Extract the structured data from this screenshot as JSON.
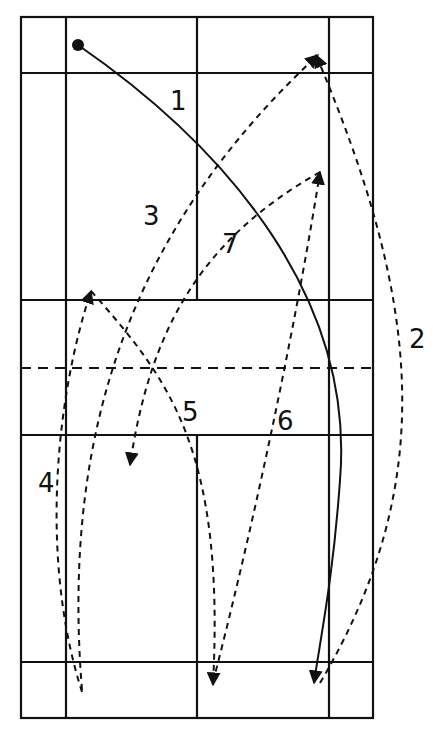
{
  "diagram": {
    "colors": {
      "line": "#111111",
      "background": "#ffffff"
    },
    "court": {
      "outer": {
        "x1": 21,
        "y1": 17,
        "x2": 373,
        "y2": 718
      },
      "side_lines_x": [
        66,
        329
      ],
      "center_line_x": 197,
      "long_service_lines_y": [
        73,
        662
      ],
      "short_service_lines_y": [
        300,
        435
      ],
      "net_y": 368
    },
    "start_point": {
      "x": 78,
      "y": 45
    },
    "shots": [
      {
        "id": "1",
        "label": "1",
        "style": "solid",
        "label_pos": [
          170,
          110
        ]
      },
      {
        "id": "2",
        "label": "2",
        "style": "dashed",
        "label_pos": [
          409,
          348
        ]
      },
      {
        "id": "3",
        "label": "3",
        "style": "dashed",
        "label_pos": [
          143,
          225
        ]
      },
      {
        "id": "4",
        "label": "4",
        "style": "dashed",
        "label_pos": [
          40,
          492
        ]
      },
      {
        "id": "5",
        "label": "5",
        "style": "dashed",
        "label_pos": [
          182,
          421
        ]
      },
      {
        "id": "6",
        "label": "6",
        "style": "dashed",
        "label_pos": [
          277,
          430
        ]
      },
      {
        "id": "7",
        "label": "7",
        "style": "dashed",
        "label_pos": [
          222,
          253
        ]
      }
    ]
  }
}
